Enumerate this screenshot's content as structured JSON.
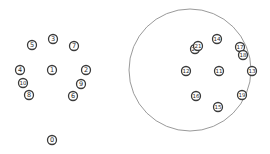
{
  "diagram": {
    "width": 270,
    "height": 154,
    "colors": {
      "node_stroke": "#3a3a3a",
      "node_fill": "#ffffff",
      "label": "#2a2a2a",
      "boundary": "#9a9a9a"
    },
    "boundary_circle": {
      "cx": 190,
      "cy": 70,
      "r": 61
    },
    "node_radius": 4.5,
    "left_cluster": [
      {
        "label": "3",
        "x": 53,
        "y": 39
      },
      {
        "label": "5",
        "x": 32,
        "y": 45
      },
      {
        "label": "7",
        "x": 74,
        "y": 46
      },
      {
        "label": "4",
        "x": 20,
        "y": 70
      },
      {
        "label": "1",
        "x": 52,
        "y": 70
      },
      {
        "label": "2",
        "x": 86,
        "y": 70
      },
      {
        "label": "10",
        "x": 23,
        "y": 83
      },
      {
        "label": "9",
        "x": 81,
        "y": 84
      },
      {
        "label": "8",
        "x": 29,
        "y": 95
      },
      {
        "label": "6",
        "x": 73,
        "y": 96
      },
      {
        "label": "0",
        "x": 52,
        "y": 140
      }
    ],
    "right_cluster": [
      {
        "label": "20",
        "x": 195,
        "y": 49
      },
      {
        "label": "21",
        "x": 198,
        "y": 46
      },
      {
        "label": "14",
        "x": 217,
        "y": 39
      },
      {
        "label": "17",
        "x": 240,
        "y": 47
      },
      {
        "label": "18",
        "x": 243,
        "y": 55
      },
      {
        "label": "12",
        "x": 186,
        "y": 71
      },
      {
        "label": "11",
        "x": 219,
        "y": 71
      },
      {
        "label": "13",
        "x": 252,
        "y": 71
      },
      {
        "label": "16",
        "x": 196,
        "y": 96
      },
      {
        "label": "19",
        "x": 242,
        "y": 95
      },
      {
        "label": "15",
        "x": 218,
        "y": 107
      }
    ]
  }
}
